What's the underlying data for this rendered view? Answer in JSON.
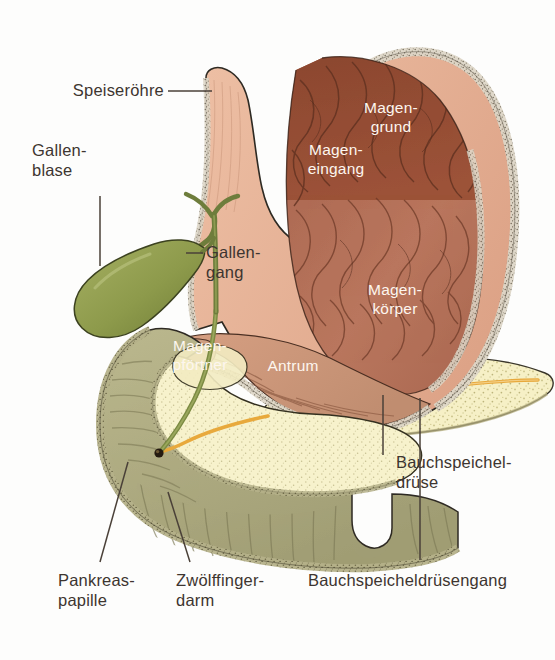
{
  "figure": {
    "background_color": "#fdfdfc",
    "label_text_color": "#3d3530",
    "inner_label_text_color": "#fdf6ef",
    "leader_line_color": "#4a4038"
  },
  "labels": {
    "esophagus": "Speiseröhre",
    "gallbladder": "Gallen-\nblase",
    "bile_duct": "Gallen-\ngang",
    "pancreas": "Bauchspeichel-\ndrüse",
    "pancreatic_duct": "Bauchspeicheldrüsengang",
    "pancreatic_papilla": "Pankreas-\npapille",
    "duodenum": "Zwölffinger-\ndarm"
  },
  "inner_labels": {
    "fundus": "Magen-\ngrund",
    "cardia": "Magen-\neingang",
    "body": "Magen-\nkörper",
    "pylorus": "Magen-\npförtner",
    "antrum": "Antrum"
  },
  "colors": {
    "stomach_wall": "#e8b79b",
    "stomach_wall_outer": "#dfa98c",
    "mucosa_border": "#d9d2c4",
    "fundus_dark": "#8d4a33",
    "stomach_lumen": "#b4705c",
    "antrum_light": "#dfa98c",
    "gallbladder_green": "#8e9b4e",
    "bile_duct_green": "#6e7d3c",
    "pancreas_cream": "#f5efc4",
    "pancreatic_duct_orange": "#e8a93c",
    "duodenum_wall": "#a8a67e",
    "duodenum_lumen": "#f7f2cc",
    "duodenum_villi": "#c7c19a",
    "outline": "#2e2a23"
  }
}
